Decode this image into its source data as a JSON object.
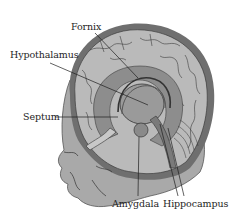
{
  "figure": {
    "colors": {
      "background": "#ffffff",
      "skull_outline": "#6f6f6f",
      "brain_surface": "#b9b9b9",
      "gyri_lines": "#3c3c3c",
      "limbic_ring": "#8d8d8d",
      "inner_structures": "#7a7a7a",
      "face_skin": "#a9a9a9",
      "label_text": "#1e1e1e",
      "leader_line": "#1e1e1e"
    },
    "labels": [
      {
        "id": "fornix",
        "text": "Fornix"
      },
      {
        "id": "hypothalamus",
        "text": "Hypothalamus"
      },
      {
        "id": "septum",
        "text": "Septum"
      },
      {
        "id": "amygdala",
        "text": "Amygdala"
      },
      {
        "id": "hippocampus",
        "text": "Hippocampus"
      }
    ]
  }
}
